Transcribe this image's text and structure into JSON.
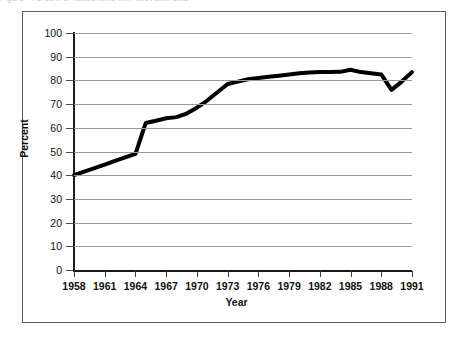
{
  "figure": {
    "caption_remnant": "Figure   ·   Percent of households with television sets",
    "background_color": "#ffffff",
    "frame_color": "#5c5c5c"
  },
  "axes": {
    "y_title": "Percent",
    "x_title": "Year",
    "y_ticks": [
      0,
      10,
      20,
      30,
      40,
      50,
      60,
      70,
      80,
      90,
      100
    ],
    "x_ticks": [
      1958,
      1961,
      1964,
      1967,
      1970,
      1973,
      1976,
      1979,
      1982,
      1985,
      1988,
      1991
    ],
    "grid": true,
    "grid_color": "#9a9a9a",
    "axis_color": "#1a1a1a"
  },
  "chart_data": {
    "type": "line",
    "title": "",
    "xlabel": "Year",
    "ylabel": "Percent",
    "xlim": [
      1958,
      1991
    ],
    "ylim": [
      0,
      100
    ],
    "grid": true,
    "legend": "none",
    "line_color": "#000000",
    "line_width_px": 4,
    "x": [
      1958,
      1959,
      1960,
      1961,
      1962,
      1963,
      1964,
      1965,
      1966,
      1967,
      1968,
      1969,
      1970,
      1971,
      1972,
      1973,
      1974,
      1975,
      1976,
      1977,
      1978,
      1979,
      1980,
      1981,
      1982,
      1983,
      1984,
      1985,
      1986,
      1987,
      1988,
      1989,
      1990,
      1991
    ],
    "values": [
      40,
      41.5,
      43,
      44.5,
      46,
      47.5,
      49,
      62,
      63,
      64,
      64.5,
      66,
      68.5,
      71.5,
      75,
      78.5,
      79.5,
      80.5,
      81,
      81.5,
      82,
      82.5,
      83,
      83.3,
      83.5,
      83.5,
      83.6,
      84.5,
      83.5,
      83,
      82.5,
      76,
      79.5,
      83.5
    ],
    "y_tick_labels": [
      "0",
      "10",
      "20",
      "30",
      "40",
      "50",
      "60",
      "70",
      "80",
      "90",
      "100"
    ],
    "x_tick_labels": [
      "1958",
      "1961",
      "1964",
      "1967",
      "1970",
      "1973",
      "1976",
      "1979",
      "1982",
      "1985",
      "1988",
      "1991"
    ],
    "annotations": [
      {
        "label": "start",
        "x": 1958,
        "y": 40
      },
      {
        "label": "sharp-rise",
        "x": 1965,
        "y": 62
      },
      {
        "label": "peak",
        "x": 1985,
        "y": 84.5
      },
      {
        "label": "dip",
        "x": 1989,
        "y": 76
      },
      {
        "label": "end",
        "x": 1991,
        "y": 83.5
      }
    ]
  }
}
